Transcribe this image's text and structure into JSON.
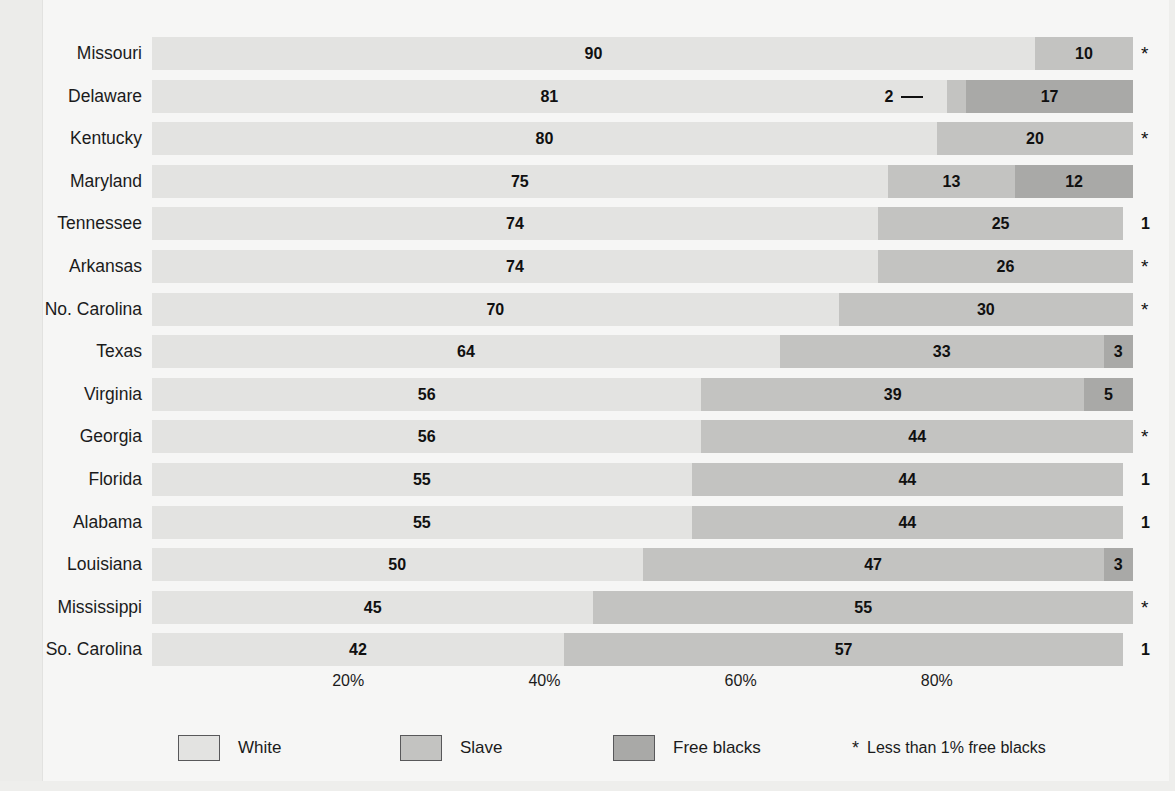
{
  "chart_data": {
    "type": "bar",
    "subtype": "stacked-horizontal-100pct",
    "title": "",
    "xlabel": "",
    "ylabel": "",
    "xlim": [
      0,
      100
    ],
    "grid": false,
    "legend_position": "bottom",
    "categories": [
      "Missouri",
      "Delaware",
      "Kentucky",
      "Maryland",
      "Tennessee",
      "Arkansas",
      "No. Carolina",
      "Texas",
      "Virginia",
      "Georgia",
      "Florida",
      "Alabama",
      "Louisiana",
      "Mississippi",
      "So. Carolina"
    ],
    "series": [
      {
        "name": "White",
        "color": "#e3e3e1",
        "values": [
          90,
          81,
          80,
          75,
          74,
          74,
          70,
          64,
          56,
          56,
          55,
          55,
          50,
          45,
          42
        ]
      },
      {
        "name": "Slave",
        "color": "#c3c3c1",
        "values": [
          10,
          2,
          20,
          13,
          25,
          26,
          30,
          33,
          39,
          44,
          44,
          44,
          47,
          55,
          57
        ]
      },
      {
        "name": "Free blacks",
        "color": "#a9a9a7",
        "values": [
          0,
          17,
          0,
          12,
          1,
          0,
          0,
          3,
          5,
          0,
          1,
          1,
          3,
          0,
          1
        ]
      }
    ],
    "tick_labels": [
      "20%",
      "40%",
      "60%",
      "80%"
    ],
    "tick_values": [
      20,
      40,
      60,
      80
    ],
    "footnote_marker": "*",
    "footnote": "Less than 1% free blacks"
  },
  "rows": [
    {
      "label": "Missouri",
      "segments": [
        {
          "series": "White",
          "value": 90,
          "label": "90",
          "start": 0,
          "end": 90
        },
        {
          "series": "Slave",
          "value": 10,
          "label": "10",
          "start": 90,
          "end": 100
        }
      ],
      "outside": "*",
      "outside_type": "star"
    },
    {
      "label": "Delaware",
      "segments": [
        {
          "series": "White",
          "value": 81,
          "label": "81",
          "start": 0,
          "end": 81
        },
        {
          "series": "Slave",
          "value": 2,
          "label": "2",
          "start": 81,
          "end": 83,
          "callout": true
        },
        {
          "series": "Free blacks",
          "value": 17,
          "label": "17",
          "start": 83,
          "end": 100
        }
      ],
      "outside": "",
      "outside_type": "none"
    },
    {
      "label": "Kentucky",
      "segments": [
        {
          "series": "White",
          "value": 80,
          "label": "80",
          "start": 0,
          "end": 80
        },
        {
          "series": "Slave",
          "value": 20,
          "label": "20",
          "start": 80,
          "end": 100
        }
      ],
      "outside": "*",
      "outside_type": "star"
    },
    {
      "label": "Maryland",
      "segments": [
        {
          "series": "White",
          "value": 75,
          "label": "75",
          "start": 0,
          "end": 75
        },
        {
          "series": "Slave",
          "value": 13,
          "label": "13",
          "start": 75,
          "end": 88
        },
        {
          "series": "Free blacks",
          "value": 12,
          "label": "12",
          "start": 88,
          "end": 100
        }
      ],
      "outside": "",
      "outside_type": "none"
    },
    {
      "label": "Tennessee",
      "segments": [
        {
          "series": "White",
          "value": 74,
          "label": "74",
          "start": 0,
          "end": 74
        },
        {
          "series": "Slave",
          "value": 25,
          "label": "25",
          "start": 74,
          "end": 99
        }
      ],
      "outside": "1",
      "outside_type": "value"
    },
    {
      "label": "Arkansas",
      "segments": [
        {
          "series": "White",
          "value": 74,
          "label": "74",
          "start": 0,
          "end": 74
        },
        {
          "series": "Slave",
          "value": 26,
          "label": "26",
          "start": 74,
          "end": 100
        }
      ],
      "outside": "*",
      "outside_type": "star"
    },
    {
      "label": "No. Carolina",
      "segments": [
        {
          "series": "White",
          "value": 70,
          "label": "70",
          "start": 0,
          "end": 70
        },
        {
          "series": "Slave",
          "value": 30,
          "label": "30",
          "start": 70,
          "end": 100
        }
      ],
      "outside": "*",
      "outside_type": "star"
    },
    {
      "label": "Texas",
      "segments": [
        {
          "series": "White",
          "value": 64,
          "label": "64",
          "start": 0,
          "end": 64
        },
        {
          "series": "Slave",
          "value": 33,
          "label": "33",
          "start": 64,
          "end": 97
        },
        {
          "series": "Free blacks",
          "value": 3,
          "label": "3",
          "start": 97,
          "end": 100
        }
      ],
      "outside": "",
      "outside_type": "none"
    },
    {
      "label": "Virginia",
      "segments": [
        {
          "series": "White",
          "value": 56,
          "label": "56",
          "start": 0,
          "end": 56
        },
        {
          "series": "Slave",
          "value": 39,
          "label": "39",
          "start": 56,
          "end": 95
        },
        {
          "series": "Free blacks",
          "value": 5,
          "label": "5",
          "start": 95,
          "end": 100
        }
      ],
      "outside": "",
      "outside_type": "none"
    },
    {
      "label": "Georgia",
      "segments": [
        {
          "series": "White",
          "value": 56,
          "label": "56",
          "start": 0,
          "end": 56
        },
        {
          "series": "Slave",
          "value": 44,
          "label": "44",
          "start": 56,
          "end": 100
        }
      ],
      "outside": "*",
      "outside_type": "star"
    },
    {
      "label": "Florida",
      "segments": [
        {
          "series": "White",
          "value": 55,
          "label": "55",
          "start": 0,
          "end": 55
        },
        {
          "series": "Slave",
          "value": 44,
          "label": "44",
          "start": 55,
          "end": 99
        }
      ],
      "outside": "1",
      "outside_type": "value"
    },
    {
      "label": "Alabama",
      "segments": [
        {
          "series": "White",
          "value": 55,
          "label": "55",
          "start": 0,
          "end": 55
        },
        {
          "series": "Slave",
          "value": 44,
          "label": "44",
          "start": 55,
          "end": 99
        }
      ],
      "outside": "1",
      "outside_type": "value"
    },
    {
      "label": "Louisiana",
      "segments": [
        {
          "series": "White",
          "value": 50,
          "label": "50",
          "start": 0,
          "end": 50
        },
        {
          "series": "Slave",
          "value": 47,
          "label": "47",
          "start": 50,
          "end": 97
        },
        {
          "series": "Free blacks",
          "value": 3,
          "label": "3",
          "start": 97,
          "end": 100
        }
      ],
      "outside": "",
      "outside_type": "none"
    },
    {
      "label": "Mississippi",
      "segments": [
        {
          "series": "White",
          "value": 45,
          "label": "45",
          "start": 0,
          "end": 45
        },
        {
          "series": "Slave",
          "value": 55,
          "label": "55",
          "start": 45,
          "end": 100
        }
      ],
      "outside": "*",
      "outside_type": "star"
    },
    {
      "label": "So. Carolina",
      "segments": [
        {
          "series": "White",
          "value": 42,
          "label": "42",
          "start": 0,
          "end": 42
        },
        {
          "series": "Slave",
          "value": 57,
          "label": "57",
          "start": 42,
          "end": 99
        }
      ],
      "outside": "1",
      "outside_type": "value"
    }
  ],
  "axis": {
    "ticks": [
      {
        "label": "20%",
        "value": 20
      },
      {
        "label": "40%",
        "value": 40
      },
      {
        "label": "60%",
        "value": 60
      },
      {
        "label": "80%",
        "value": 80
      }
    ]
  },
  "legend": {
    "items": [
      {
        "label": "White",
        "color": "#e3e3e1",
        "x": 178
      },
      {
        "label": "Slave",
        "color": "#c3c3c1",
        "x": 400
      },
      {
        "label": "Free blacks",
        "color": "#a9a9a7",
        "x": 613
      },
      {
        "label": "Free blacks",
        "color": "#a9a9a7",
        "x": 613
      }
    ],
    "note_marker": "*",
    "note_text": "Less than 1% free blacks",
    "note_x": 852
  }
}
